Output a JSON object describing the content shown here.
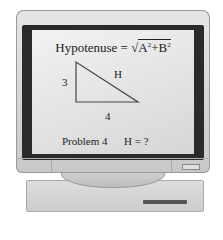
{
  "illustration": {
    "subject": "computer monitor displaying a math problem",
    "screen": {
      "formula": {
        "label": "Hypotenuse",
        "equals": "=",
        "radical": "√",
        "term_a": "A",
        "exp_a": "2",
        "plus": "+",
        "term_b": "B",
        "exp_b": "2"
      },
      "triangle": {
        "side_vertical": "3",
        "side_horizontal": "4",
        "hypotenuse": "H"
      },
      "problem_label": "Problem 4",
      "answer": "H = ?"
    }
  },
  "colors": {
    "bezel": "#d8d8d8",
    "screen_border": "#2a2a2a",
    "screen_bg": "#e8e8e8",
    "text": "#222222"
  }
}
